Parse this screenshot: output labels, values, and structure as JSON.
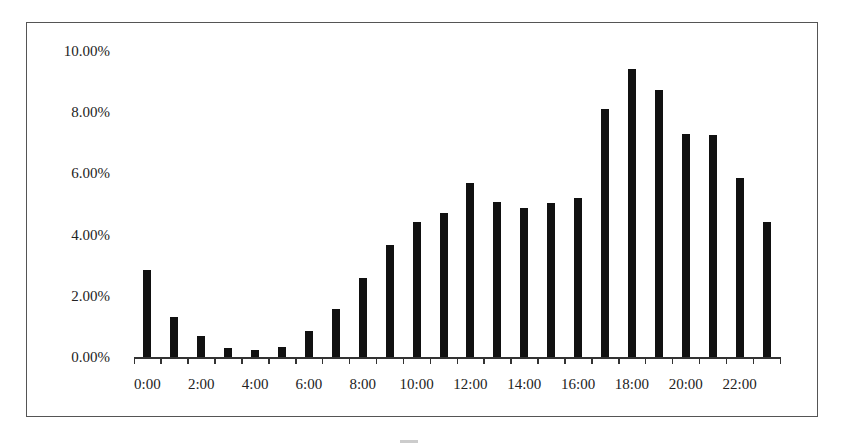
{
  "chart_data": {
    "type": "bar",
    "title": "",
    "xlabel": "",
    "ylabel": "",
    "ylim": [
      0,
      10
    ],
    "grid": false,
    "legend": null,
    "y_tick_labels": [
      "0.00%",
      "2.00%",
      "4.00%",
      "6.00%",
      "8.00%",
      "10.00%"
    ],
    "x_tick_labels": [
      "0:00",
      "2:00",
      "4:00",
      "6:00",
      "8:00",
      "10:00",
      "12:00",
      "14:00",
      "16:00",
      "18:00",
      "20:00",
      "22:00"
    ],
    "categories": [
      "0:00",
      "1:00",
      "2:00",
      "3:00",
      "4:00",
      "5:00",
      "6:00",
      "7:00",
      "8:00",
      "9:00",
      "10:00",
      "11:00",
      "12:00",
      "13:00",
      "14:00",
      "15:00",
      "16:00",
      "17:00",
      "18:00",
      "19:00",
      "20:00",
      "21:00",
      "22:00",
      "23:00"
    ],
    "values": [
      2.85,
      1.31,
      0.69,
      0.29,
      0.23,
      0.33,
      0.85,
      1.57,
      2.58,
      3.66,
      4.41,
      4.71,
      5.69,
      5.07,
      4.87,
      5.03,
      5.2,
      8.1,
      9.41,
      8.73,
      7.29,
      7.25,
      5.85,
      4.41
    ],
    "unit": "%",
    "bar_color": "#111111"
  }
}
